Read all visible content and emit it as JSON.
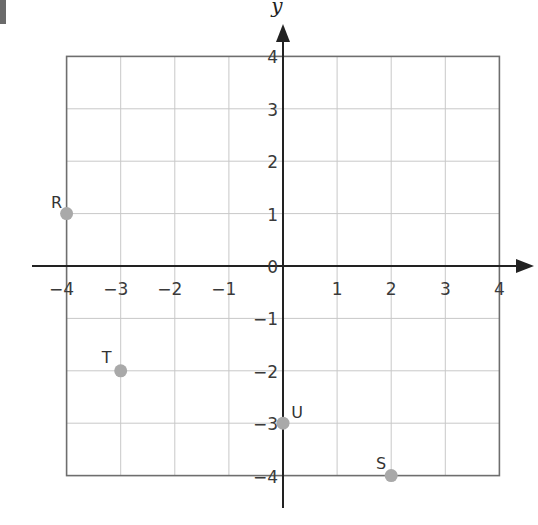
{
  "chart_data": {
    "type": "scatter",
    "title": "",
    "xlabel": "",
    "ylabel": "y",
    "xlim": [
      -4,
      4
    ],
    "ylim": [
      -4,
      4
    ],
    "grid": true,
    "x_ticks": [
      "−4",
      "−3",
      "−2",
      "−1",
      "1",
      "2",
      "3",
      "4"
    ],
    "y_ticks": [
      "4",
      "3",
      "2",
      "1",
      "0",
      "−1",
      "−2",
      "−3",
      "−4"
    ],
    "origin_label": "0",
    "points": [
      {
        "label": "R",
        "x": -4,
        "y": 1
      },
      {
        "label": "T",
        "x": -3,
        "y": -2
      },
      {
        "label": "U",
        "x": 0,
        "y": -3
      },
      {
        "label": "S",
        "x": 2,
        "y": -4
      }
    ],
    "colors": {
      "point": "#a9a9a9",
      "grid": "#c8c8c8",
      "border": "#6e6e6e",
      "axis": "#222222"
    }
  }
}
